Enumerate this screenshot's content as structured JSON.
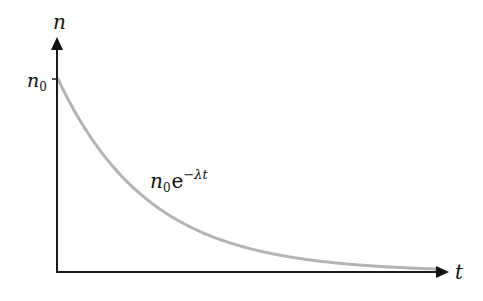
{
  "chart_data": {
    "type": "line",
    "title": "",
    "xlabel": "t",
    "ylabel": "n",
    "y_tick_label": "n",
    "y_tick_subscript": "0",
    "curve_label": {
      "base": "n",
      "base_subscript": "0",
      "exp_base": "e",
      "exponent": "−λt"
    },
    "function": "n0 * exp(-lambda * t)",
    "series": [
      {
        "name": "n0 e^(-λt)",
        "color": "#b3b3b3",
        "x": [
          0,
          0.5,
          1,
          1.5,
          2,
          2.5,
          3,
          3.5,
          4
        ],
        "values": [
          1.0,
          0.61,
          0.37,
          0.22,
          0.14,
          0.08,
          0.05,
          0.03,
          0.02
        ]
      }
    ],
    "axis_color": "#1a1a1a",
    "grid": false,
    "legend": "none",
    "ylim": [
      0,
      1.2
    ]
  }
}
